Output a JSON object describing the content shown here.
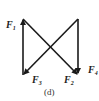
{
  "figure": {
    "caption": "(d)",
    "stroke_color": "#1a1a1a",
    "forces": [
      {
        "id": "F1",
        "label": "F",
        "subscript": "1",
        "direction": "up",
        "position": "left vertical"
      },
      {
        "id": "F2",
        "label": "F",
        "subscript": "2",
        "direction": "diagonal down-right",
        "position": "top-left to bottom-right"
      },
      {
        "id": "F3",
        "label": "F",
        "subscript": "3",
        "direction": "diagonal down-left",
        "position": "top-right to bottom-left"
      },
      {
        "id": "F4",
        "label": "F",
        "subscript": "4",
        "direction": "down",
        "position": "right vertical"
      }
    ]
  }
}
